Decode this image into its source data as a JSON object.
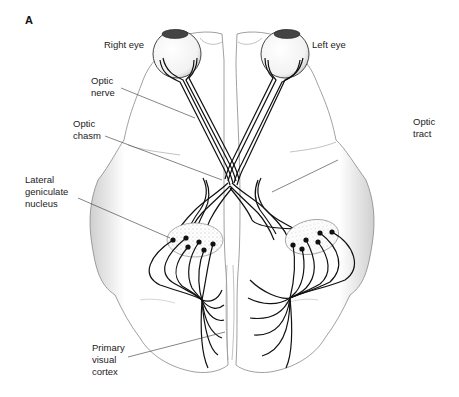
{
  "figure": {
    "panel_letter": "A",
    "labels": {
      "right_eye": "Right eye",
      "left_eye": "Left eye",
      "optic_nerve": "Optic\nnerve",
      "optic_chiasm": "Optic\nchasm",
      "optic_tract": "Optic\ntract",
      "lateral_geniculate_nucleus": "Lateral\ngeniculate\nnucleus",
      "primary_visual_cortex": "Primary\nvisual\ncortex"
    },
    "colors": {
      "ink": "#111111",
      "stipple": "#888888",
      "background": "#ffffff"
    }
  }
}
